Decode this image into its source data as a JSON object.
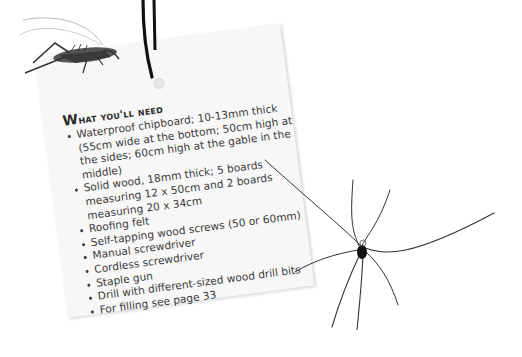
{
  "card": {
    "heading_first": "W",
    "heading_rest": "hat you'll need",
    "items": [
      "Waterproof chipboard; 10-13mm thick (55cm wide at the bottom; 50cm high at the sides; 60cm high at the gable in the middle)",
      "Solid wood, 18mm thick; 5 boards measuring 12 x 50cm and 2 boards measuring 20 x 34cm",
      "Roofing felt",
      "Self-tapping wood screws (50 or 60mm)",
      "Manual screwdriver",
      "Cordless screwdriver",
      "Staple gun",
      "Drill with different-sized wood drill bits",
      "For filling see page 33"
    ]
  },
  "illustrations": {
    "top_left": "cricket-icon",
    "right": "spider-icon",
    "tag_string": "string-icon"
  }
}
